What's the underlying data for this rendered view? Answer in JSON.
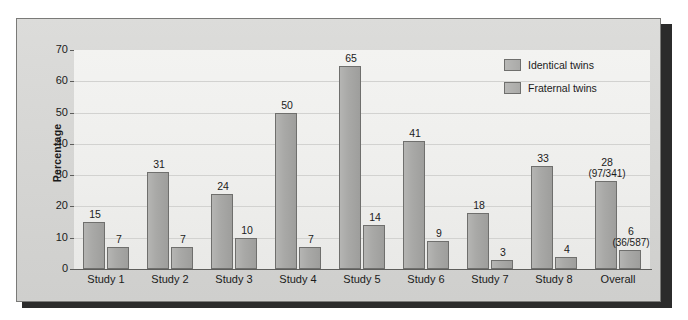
{
  "figure": {
    "y_axis_title": "Percentage"
  },
  "legend": {
    "items": [
      {
        "label": "Identical twins",
        "key": "identical"
      },
      {
        "label": "Fraternal twins",
        "key": "fraternal"
      }
    ]
  },
  "chart_data": {
    "type": "bar",
    "title": "",
    "xlabel": "",
    "ylabel": "Percentage",
    "ylim": [
      0,
      70
    ],
    "yticks": [
      0,
      10,
      20,
      30,
      40,
      50,
      60,
      70
    ],
    "grid": true,
    "legend_position": "top-right",
    "categories": [
      "Study 1",
      "Study 2",
      "Study 3",
      "Study 4",
      "Study 5",
      "Study 6",
      "Study 7",
      "Study 8",
      "Overall"
    ],
    "series": [
      {
        "name": "Identical twins",
        "values": [
          15,
          31,
          24,
          50,
          65,
          41,
          18,
          33,
          28
        ],
        "labels": [
          "15",
          "31",
          "24",
          "50",
          "65",
          "41",
          "18",
          "33",
          "28"
        ],
        "sublabels": [
          "",
          "",
          "",
          "",
          "",
          "",
          "",
          "",
          "(97/341)"
        ]
      },
      {
        "name": "Fraternal twins",
        "values": [
          7,
          7,
          10,
          7,
          14,
          9,
          3,
          4,
          6
        ],
        "labels": [
          "7",
          "7",
          "10",
          "7",
          "14",
          "9",
          "3",
          "4",
          "6"
        ],
        "sublabels": [
          "",
          "",
          "",
          "",
          "",
          "",
          "",
          "",
          "(36/587)"
        ]
      }
    ]
  },
  "colors": {
    "bar_fill": "#aaaaa8",
    "bar_stroke": "#6f6f6d",
    "frame_bg": "#d6d6d4",
    "plot_bg": "#eeeeec",
    "axis": "#5d5d5b",
    "text": "#1b1b1b"
  }
}
